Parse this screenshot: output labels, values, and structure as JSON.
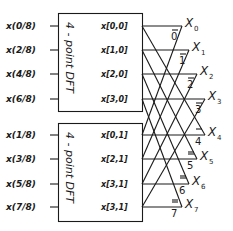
{
  "diagram": {
    "type": "radix-2 decimation-in-time FFT butterfly (8-point from two 4-point DFTs)",
    "blocks": [
      {
        "title": "4 - point DFT",
        "inputs": [
          "x(0/8)",
          "x(2/8)",
          "x(4/8)",
          "x(6/8)"
        ],
        "outputs": [
          "x[0,0]",
          "x[1,0]",
          "x[2,0]",
          "x[3,0]"
        ]
      },
      {
        "title": "4 - point DFT",
        "inputs": [
          "x(1/8)",
          "x(3/8)",
          "x(5/8)",
          "x(7/8)"
        ],
        "outputs": [
          "x[0,1]",
          "x[2,1]",
          "x[3,1]",
          "x[3,1]"
        ]
      }
    ],
    "outputs": [
      {
        "name": "X",
        "sub": "0",
        "twiddle": "0"
      },
      {
        "name": "X",
        "sub": "1",
        "twiddle": "1"
      },
      {
        "name": "X",
        "sub": "2",
        "twiddle": "2"
      },
      {
        "name": "X",
        "sub": "3",
        "twiddle": "3"
      },
      {
        "name": "X",
        "sub": "4",
        "twiddle": "4"
      },
      {
        "name": "X",
        "sub": "5",
        "twiddle": "5"
      },
      {
        "name": "X",
        "sub": "6",
        "twiddle": "6"
      },
      {
        "name": "X",
        "sub": "7",
        "twiddle": "7"
      }
    ],
    "colors": {
      "ink": "#1a1a1a",
      "background": "#ffffff"
    }
  }
}
